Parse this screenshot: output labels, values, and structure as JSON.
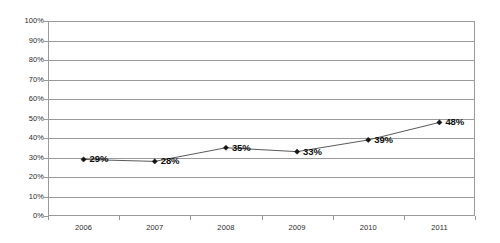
{
  "chart_data": {
    "type": "line",
    "title": "",
    "subtitle": "",
    "xlabel": "",
    "ylabel": "",
    "categories": [
      "2006",
      "2007",
      "2008",
      "2009",
      "2010",
      "2011"
    ],
    "values": [
      29,
      28,
      35,
      33,
      39,
      48
    ],
    "point_labels": [
      "29%",
      "28%",
      "35%",
      "33%",
      "39%",
      "48%"
    ],
    "ylim": [
      0,
      100
    ],
    "ytick_labels": [
      "100%",
      "90%",
      "80%",
      "70%",
      "60%",
      "50%",
      "40%",
      "30%",
      "20%",
      "10%",
      "0%"
    ],
    "ytick_values": [
      100,
      90,
      80,
      70,
      60,
      50,
      40,
      30,
      20,
      10,
      0
    ],
    "grid": "horizontal",
    "legend": "none",
    "series_name": "",
    "annotations": [],
    "colors": {
      "line": "#5a5a5a",
      "marker": "#141414",
      "gridline": "#9a9a9a",
      "axis": "#9a9a9a",
      "label_text": "#2b2b2b",
      "data_label_text": "#0d0d0d",
      "background": "#ffffff"
    }
  }
}
